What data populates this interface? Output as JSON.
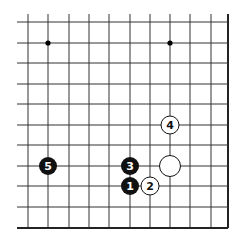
{
  "diagram": {
    "type": "go-board-fragment",
    "colors": {
      "line": "#333333",
      "edge": "#222222",
      "black_stone": "#111111",
      "white_stone": "#ffffff",
      "black_text": "#ffffff",
      "white_text": "#111111"
    },
    "grid": {
      "x": [
        28,
        48,
        69,
        89,
        109,
        130,
        150,
        170,
        190,
        211,
        228
      ],
      "y": [
        22,
        43,
        63,
        84,
        104,
        125,
        145,
        166,
        186,
        207,
        228
      ],
      "open_left": 17,
      "open_top": 14,
      "right_edge": 228,
      "bottom_edge": 228
    },
    "star_points": [
      {
        "col": 1,
        "row": 1
      },
      {
        "col": 7,
        "row": 1
      }
    ],
    "stones": [
      {
        "color": "black",
        "col": 5,
        "row": 8,
        "label": "1"
      },
      {
        "color": "white",
        "col": 6,
        "row": 8,
        "label": "2"
      },
      {
        "color": "black",
        "col": 5,
        "row": 7,
        "label": "3"
      },
      {
        "color": "white",
        "col": 7,
        "row": 5,
        "label": "4"
      },
      {
        "color": "black",
        "col": 1,
        "row": 7,
        "label": "5"
      },
      {
        "color": "white",
        "col": 7,
        "row": 7,
        "label": "",
        "large": true
      }
    ]
  }
}
